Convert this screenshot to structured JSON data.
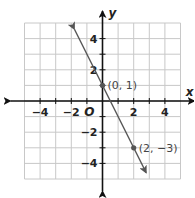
{
  "chart_data": {
    "type": "line",
    "title": "",
    "xlabel": "x",
    "ylabel": "y",
    "origin_label": "O",
    "xlim": [
      -5,
      5
    ],
    "ylim": [
      -5,
      5
    ],
    "grid": true,
    "grid_step": 1,
    "x_ticks": [
      -4,
      -2,
      2,
      4
    ],
    "y_ticks": [
      4,
      2,
      -2,
      -4
    ],
    "x_tick_labels": [
      "−4",
      "−2",
      "2",
      "4"
    ],
    "y_tick_labels": [
      "4",
      "2",
      "−2",
      "−4"
    ],
    "series": [
      {
        "name": "line",
        "equation": "y = -2x + 1",
        "slope": -2,
        "intercept": 1,
        "x": [
          -1.8,
          2.8
        ],
        "y": [
          4.6,
          -4.6
        ],
        "color": "#555555",
        "arrows": "both"
      }
    ],
    "points": [
      {
        "x": 0,
        "y": 1,
        "label": "(0, 1)"
      },
      {
        "x": 2,
        "y": -3,
        "label": "(2, −3)"
      }
    ],
    "legend": null
  },
  "colors": {
    "grid": "#c8c8c8",
    "axis": "#111111",
    "line": "#555555",
    "point": "#555555"
  }
}
